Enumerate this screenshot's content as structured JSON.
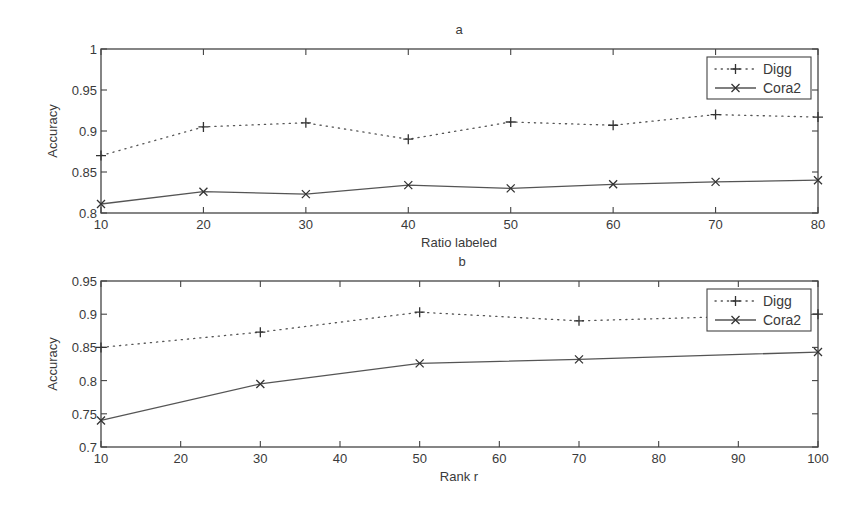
{
  "figure": {
    "panels": [
      {
        "id": "a",
        "title": "a",
        "xlabel": "Ratio labeled",
        "ylabel": "Accuracy",
        "legend": [
          {
            "label": "Digg",
            "style": "dotted",
            "marker": "plus"
          },
          {
            "label": "Cora2",
            "style": "solid",
            "marker": "x"
          }
        ]
      },
      {
        "id": "b",
        "title": "b",
        "xlabel": "Rank r",
        "ylabel": "Accuracy",
        "legend": [
          {
            "label": "Digg",
            "style": "dotted",
            "marker": "plus"
          },
          {
            "label": "Cora2",
            "style": "solid",
            "marker": "x"
          }
        ]
      }
    ]
  },
  "chart_data": [
    {
      "type": "line",
      "title": "a",
      "xlabel": "Ratio labeled",
      "ylabel": "Accuracy",
      "x": [
        10,
        20,
        30,
        40,
        50,
        60,
        70,
        80
      ],
      "xlim": [
        10,
        80
      ],
      "ylim": [
        0.8,
        1.0
      ],
      "xticks": [
        10,
        20,
        30,
        40,
        50,
        60,
        70,
        80
      ],
      "yticks": [
        0.8,
        0.85,
        0.9,
        0.95,
        1
      ],
      "ytick_labels": [
        "0.8",
        "0.85",
        "0.9",
        "0.95",
        "1"
      ],
      "grid": false,
      "legend_position": "upper right",
      "series": [
        {
          "name": "Digg",
          "line": "dotted",
          "marker": "+",
          "values": [
            0.87,
            0.905,
            0.91,
            0.89,
            0.911,
            0.907,
            0.92,
            0.917
          ]
        },
        {
          "name": "Cora2",
          "line": "solid",
          "marker": "x",
          "values": [
            0.811,
            0.826,
            0.823,
            0.834,
            0.83,
            0.835,
            0.838,
            0.84
          ]
        }
      ]
    },
    {
      "type": "line",
      "title": "b",
      "xlabel": "Rank r",
      "ylabel": "Accuracy",
      "x": [
        10,
        30,
        50,
        70,
        100
      ],
      "xlim": [
        10,
        100
      ],
      "ylim": [
        0.7,
        0.95
      ],
      "xticks": [
        10,
        20,
        30,
        40,
        50,
        60,
        70,
        80,
        90,
        100
      ],
      "yticks": [
        0.7,
        0.75,
        0.8,
        0.85,
        0.9,
        0.95
      ],
      "ytick_labels": [
        "0.7",
        "0.75",
        "0.8",
        "0.85",
        "0.9",
        "0.95"
      ],
      "grid": false,
      "legend_position": "upper right",
      "series": [
        {
          "name": "Digg",
          "line": "dotted",
          "marker": "+",
          "values": [
            0.85,
            0.873,
            0.903,
            0.89,
            0.9
          ]
        },
        {
          "name": "Cora2",
          "line": "solid",
          "marker": "x",
          "values": [
            0.74,
            0.795,
            0.826,
            0.832,
            0.843
          ]
        }
      ]
    }
  ]
}
